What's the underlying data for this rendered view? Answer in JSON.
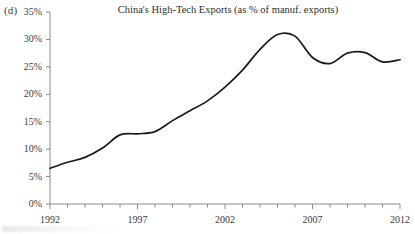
{
  "panel": {
    "label": "(d)"
  },
  "chart_data": {
    "type": "line",
    "title": "China's High-Tech Exports (as % of manuf. exports)",
    "xlabel": "",
    "ylabel": "",
    "xlim": [
      1992,
      2012
    ],
    "ylim": [
      0,
      35
    ],
    "grid": false,
    "legend": null,
    "y_tick_labels": [
      "35%",
      "30%",
      "25%",
      "20%",
      "15%",
      "10%",
      "5%",
      "0%"
    ],
    "y_ticks": [
      35,
      30,
      25,
      20,
      15,
      10,
      5,
      0
    ],
    "x_tick_labels": [
      "1992",
      "1997",
      "2002",
      "2007",
      "2012"
    ],
    "x_ticks": [
      1992,
      1997,
      2002,
      2007,
      2012
    ],
    "x_minor_ticks": [
      1993,
      1994,
      1995,
      1996,
      1998,
      1999,
      2000,
      2001,
      2003,
      2004,
      2005,
      2006,
      2008,
      2009,
      2010,
      2011
    ],
    "x": [
      1992,
      1993,
      1994,
      1995,
      1996,
      1997,
      1998,
      1999,
      2000,
      2001,
      2002,
      2003,
      2004,
      2005,
      2006,
      2007,
      2008,
      2009,
      2010,
      2011,
      2012
    ],
    "values": [
      6.5,
      7.6,
      8.5,
      10.2,
      12.6,
      12.8,
      13.2,
      15.2,
      17.0,
      18.8,
      21.3,
      24.4,
      28.2,
      30.9,
      30.6,
      26.7,
      25.6,
      27.5,
      27.6,
      25.9,
      26.3
    ],
    "series": [
      {
        "name": "China's High-Tech Exports",
        "color": "#1a1a1a",
        "values": [
          6.5,
          7.6,
          8.5,
          10.2,
          12.6,
          12.8,
          13.2,
          15.2,
          17.0,
          18.8,
          21.3,
          24.4,
          28.2,
          30.9,
          30.6,
          26.7,
          25.6,
          27.5,
          27.6,
          25.9,
          26.3
        ]
      }
    ]
  },
  "style": {
    "line_color": "#1a1a1a",
    "axis_color": "#8a8a8a",
    "text_color": "#3a3a3a",
    "background": "#ffffff"
  }
}
